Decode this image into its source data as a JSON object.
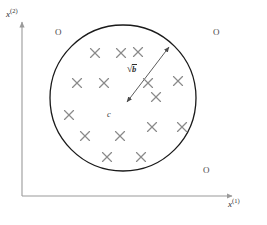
{
  "figure": {
    "background_color": "#ffffff",
    "width": 267,
    "height": 225
  },
  "axes": {
    "x_label_base": "x",
    "x_label_sup": "(1)",
    "y_label_base": "x",
    "y_label_sup": "(2)",
    "color": "#9a9a9a",
    "origin": {
      "x": 22,
      "y": 196
    },
    "x_end": {
      "x": 236,
      "y": 196
    },
    "y_end": {
      "x": 22,
      "y": 18
    }
  },
  "region": {
    "shape_name": "circle",
    "center": {
      "x": 123,
      "y": 98
    },
    "radius": 73,
    "stroke_color": "#1a1a1a",
    "stroke_width": 1.3,
    "fill": "none",
    "center_marker_label": "c"
  },
  "radius_annotation": {
    "label_sqrt_sign": "√",
    "label_radicand": "b",
    "full_label": "√b",
    "line_start": {
      "x": 169,
      "y": 47
    },
    "line_end": {
      "x": 127,
      "y": 102
    },
    "color": "#4a4a4a",
    "double_headed": true
  },
  "inliers": {
    "marker_name": "cross-marker",
    "symbol": "×",
    "color": "#8a8a8a",
    "size": 9,
    "count": 15,
    "points": [
      {
        "x": 95,
        "y": 53
      },
      {
        "x": 121,
        "y": 53
      },
      {
        "x": 138,
        "y": 52
      },
      {
        "x": 77,
        "y": 83
      },
      {
        "x": 104,
        "y": 83
      },
      {
        "x": 178,
        "y": 81
      },
      {
        "x": 156,
        "y": 97
      },
      {
        "x": 69,
        "y": 115
      },
      {
        "x": 152,
        "y": 127
      },
      {
        "x": 182,
        "y": 127
      },
      {
        "x": 85,
        "y": 136
      },
      {
        "x": 120,
        "y": 136
      },
      {
        "x": 107,
        "y": 157
      },
      {
        "x": 141,
        "y": 157
      },
      {
        "x": 148,
        "y": 83
      }
    ]
  },
  "outliers": {
    "marker_name": "o-marker",
    "symbol": "O",
    "color": "#4a4a4a",
    "count": 3,
    "points": [
      {
        "x": 55,
        "y": 28,
        "label": "O"
      },
      {
        "x": 213,
        "y": 28,
        "label": "O"
      },
      {
        "x": 203,
        "y": 166,
        "label": "O"
      }
    ]
  },
  "colors": {
    "axis": "#9a9a9a",
    "circle": "#1a1a1a",
    "cross": "#8a8a8a",
    "text": "#3a3a3a",
    "arrow": "#4a4a4a"
  }
}
